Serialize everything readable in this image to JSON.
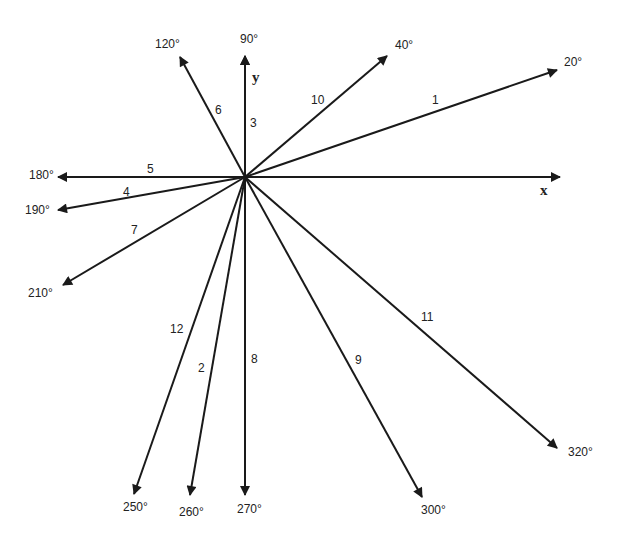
{
  "diagram": {
    "type": "vector-diagram",
    "origin": {
      "x": 245,
      "y": 177
    },
    "axes": {
      "x": {
        "label": "x",
        "tip": {
          "x": 560,
          "y": 177
        },
        "label_pos": {
          "x": 540,
          "y": 195
        }
      },
      "y": {
        "label": "y",
        "tip": {
          "x": 245,
          "y": 56
        },
        "label_pos": {
          "x": 252,
          "y": 82
        }
      }
    },
    "vectors": [
      {
        "id": "1",
        "angle_label": "20°",
        "tip": {
          "x": 557,
          "y": 70
        },
        "angle_pos": {
          "x": 564,
          "y": 66
        },
        "num_pos": {
          "x": 432,
          "y": 104
        }
      },
      {
        "id": "2",
        "angle_label": "260°",
        "tip": {
          "x": 190,
          "y": 495
        },
        "angle_pos": {
          "x": 179,
          "y": 516
        },
        "num_pos": {
          "x": 198,
          "y": 372
        }
      },
      {
        "id": "3",
        "angle_label": "90°",
        "tip": {
          "x": 245,
          "y": 56
        },
        "angle_pos": {
          "x": 240,
          "y": 43
        },
        "num_pos": {
          "x": 250,
          "y": 127
        }
      },
      {
        "id": "4",
        "angle_label": "190°",
        "tip": {
          "x": 58,
          "y": 210
        },
        "angle_pos": {
          "x": 25,
          "y": 214
        },
        "num_pos": {
          "x": 123,
          "y": 196
        }
      },
      {
        "id": "5",
        "angle_label": "180°",
        "tip": {
          "x": 58,
          "y": 177
        },
        "angle_pos": {
          "x": 29,
          "y": 179
        },
        "num_pos": {
          "x": 147,
          "y": 173
        }
      },
      {
        "id": "6",
        "angle_label": "120°",
        "tip": {
          "x": 180,
          "y": 57
        },
        "angle_pos": {
          "x": 155,
          "y": 48
        },
        "num_pos": {
          "x": 215,
          "y": 114
        }
      },
      {
        "id": "7",
        "angle_label": "210°",
        "tip": {
          "x": 63,
          "y": 285
        },
        "angle_pos": {
          "x": 28,
          "y": 297
        },
        "num_pos": {
          "x": 131,
          "y": 234
        }
      },
      {
        "id": "8",
        "angle_label": "270°",
        "tip": {
          "x": 245,
          "y": 495
        },
        "angle_pos": {
          "x": 237,
          "y": 513
        },
        "num_pos": {
          "x": 251,
          "y": 363
        }
      },
      {
        "id": "9",
        "angle_label": "300°",
        "tip": {
          "x": 422,
          "y": 497
        },
        "angle_pos": {
          "x": 421,
          "y": 514
        },
        "num_pos": {
          "x": 355,
          "y": 364
        }
      },
      {
        "id": "10",
        "angle_label": "40°",
        "tip": {
          "x": 387,
          "y": 56
        },
        "angle_pos": {
          "x": 395,
          "y": 49
        },
        "num_pos": {
          "x": 311,
          "y": 104
        }
      },
      {
        "id": "11",
        "angle_label": "320°",
        "tip": {
          "x": 557,
          "y": 448
        },
        "angle_pos": {
          "x": 568,
          "y": 456
        },
        "num_pos": {
          "x": 421,
          "y": 321
        }
      },
      {
        "id": "12",
        "angle_label": "250°",
        "tip": {
          "x": 134,
          "y": 494
        },
        "angle_pos": {
          "x": 123,
          "y": 511
        },
        "num_pos": {
          "x": 170,
          "y": 333
        }
      }
    ]
  }
}
